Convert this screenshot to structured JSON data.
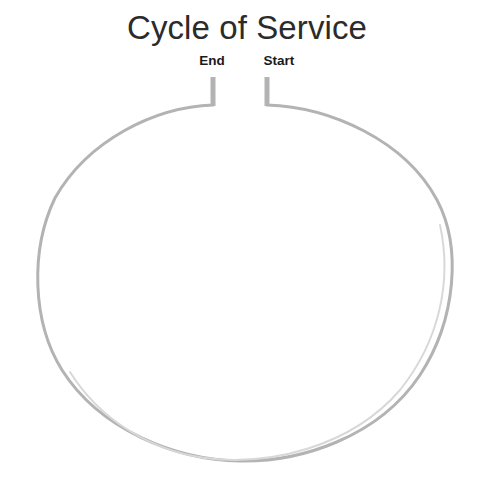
{
  "diagram": {
    "title": "Cycle of Service",
    "type": "open-cycle-loop",
    "background_color": "#ffffff",
    "title_color": "#2b2b2b",
    "label_color": "#1a1a1a",
    "stroke_color": "#b3b3b3",
    "stroke_width": 3,
    "nodes": [
      {
        "id": "end",
        "label": "End",
        "position": "top-left-of-gap",
        "stub_x": 213,
        "stub_top_y": 77,
        "stub_bottom_y": 105
      },
      {
        "id": "start",
        "label": "Start",
        "position": "top-right-of-gap",
        "stub_x": 267,
        "stub_top_y": 77,
        "stub_bottom_y": 105
      }
    ],
    "loop": {
      "shape": "ellipse",
      "center_x": 244,
      "center_y": 281,
      "radius_x": 206,
      "radius_y": 180,
      "gap_at": "top",
      "gap_left_x": 213,
      "gap_right_x": 267
    }
  },
  "chart_data": {
    "type": "diagram",
    "title": "Cycle of Service",
    "subtitle": "",
    "xlabel": "",
    "ylabel": "",
    "legend": [],
    "annotations": [
      "End",
      "Start"
    ],
    "series": [
      {
        "name": "cycle-loop",
        "description": "Open ellipse loop with a gap at the top; two vertical connector stubs mark the gap ends.",
        "points": []
      }
    ]
  }
}
